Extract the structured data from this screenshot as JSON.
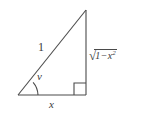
{
  "figure": {
    "name": "right-triangle-trig-diagram",
    "background_color": "#ffffff",
    "stroke_color": "#4a4a4a",
    "text_color": "#3a3a3a"
  },
  "geometry": {
    "vertex_left": {
      "x": 18,
      "y": 95
    },
    "vertex_right": {
      "x": 86,
      "y": 95
    },
    "vertex_top": {
      "x": 86,
      "y": 10
    },
    "right_angle_marker": {
      "x": 74,
      "y": 83,
      "size": 12
    },
    "angle_arc": {
      "center_x": 18,
      "center_y": 95,
      "radius": 20
    }
  },
  "labels": {
    "hypotenuse": "1",
    "adjacent": "x",
    "angle": "v",
    "opposite": {
      "radical": "√",
      "one": "1",
      "minus": "−",
      "variable": "x",
      "exponent": "2",
      "full_text": "√(1 − x²)"
    }
  }
}
